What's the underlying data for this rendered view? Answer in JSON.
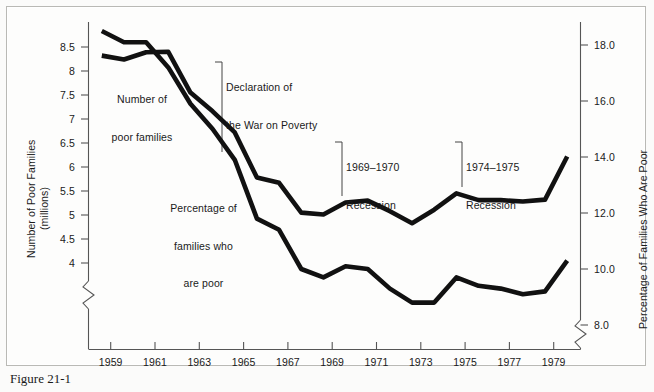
{
  "figure": {
    "caption": "Figure 21-1",
    "background": "#fbfbfa",
    "line_color": "#111111",
    "axis_color": "#555555"
  },
  "chart_data": {
    "type": "line",
    "title": "",
    "xlabel": "",
    "ylabel": "Number of Poor Families (millions)",
    "y2label": "Percentage of Families Who Are Poor",
    "grid": false,
    "legend": "inline-annotations",
    "x": [
      1959,
      1960,
      1961,
      1962,
      1963,
      1964,
      1965,
      1966,
      1967,
      1968,
      1969,
      1970,
      1971,
      1972,
      1973,
      1974,
      1975,
      1976,
      1977,
      1978,
      1979,
      1980
    ],
    "xtick_labels": [
      "1959",
      "1961",
      "1963",
      "1965",
      "1967",
      "1969",
      "1971",
      "1973",
      "1975",
      "1977",
      "1979"
    ],
    "xtick_values": [
      1959,
      1961,
      1963,
      1965,
      1967,
      1969,
      1971,
      1973,
      1975,
      1977,
      1979
    ],
    "xlim": [
      1958.4,
      1980.6
    ],
    "x_axis_break": true,
    "ylim": [
      3.6,
      8.9
    ],
    "ytick_labels": [
      "8.5",
      "8",
      "7.5",
      "7",
      "6.5",
      "6",
      "5.5",
      "5",
      "4.5",
      "4"
    ],
    "ytick_values": [
      8.5,
      8,
      7.5,
      7,
      6.5,
      6,
      5.5,
      5,
      4.5,
      4
    ],
    "y_axis_break": true,
    "y2lim": [
      7.1,
      19.4
    ],
    "y2tick_labels": [
      "18.0",
      "16.0",
      "14.0",
      "12.0",
      "10.0",
      "8.0"
    ],
    "y2tick_values": [
      18.0,
      16.0,
      14.0,
      12.0,
      10.0,
      8.0
    ],
    "y2_axis_break": true,
    "series": [
      {
        "name": "Number of poor families",
        "axis": "left",
        "unit": "millions",
        "values": [
          8.32,
          8.24,
          8.39,
          8.4,
          7.55,
          7.16,
          6.72,
          5.78,
          5.67,
          5.05,
          5.01,
          5.26,
          5.3,
          5.08,
          4.83,
          5.11,
          5.45,
          5.31,
          5.31,
          5.28,
          5.32,
          6.22
        ]
      },
      {
        "name": "Percentage of families who are poor",
        "axis": "right",
        "unit": "percent",
        "values": [
          18.5,
          18.1,
          18.1,
          17.2,
          15.9,
          15.0,
          13.9,
          11.8,
          11.4,
          10.0,
          9.7,
          10.1,
          10.0,
          9.3,
          8.8,
          8.8,
          9.7,
          9.4,
          9.3,
          9.1,
          9.2,
          10.3
        ]
      }
    ],
    "annotations": [
      {
        "id": "series-label-number",
        "text": "Number of\npoor families",
        "align": "center"
      },
      {
        "id": "series-label-percentage",
        "text": "Percentage of\nfamilies who\nare poor",
        "align": "center"
      },
      {
        "id": "event-war-on-poverty",
        "text": "Declaration of\nthe War on Poverty",
        "leader": true
      },
      {
        "id": "event-recession-1969",
        "text": "1969–1970\nRecession",
        "leader": true
      },
      {
        "id": "event-recession-1974",
        "text": "1974–1975\nRecession",
        "leader": true
      }
    ]
  },
  "axes": {
    "left_title_line1": "Number of Poor Families",
    "left_title_line2": "(millions)",
    "right_title": "Percentage of Families Who Are Poor"
  },
  "annotations": {
    "number_l1": "Number of",
    "number_l2": "poor families",
    "percentage_l1": "Percentage of",
    "percentage_l2": "families who",
    "percentage_l3": "are poor",
    "war_l1": "Declaration of",
    "war_l2": "the War on Poverty",
    "rec69_l1": "1969–1970",
    "rec69_l2": "Recession",
    "rec74_l1": "1974–1975",
    "rec74_l2": "Recession"
  }
}
